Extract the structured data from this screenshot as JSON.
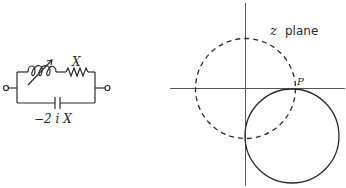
{
  "circuit": {
    "inductor_label": "",
    "resistor_label": "X",
    "capacitor_label": "−2 i X",
    "components": [
      "variable-inductor",
      "resistor",
      "capacitor"
    ]
  },
  "plane": {
    "title_var": "z",
    "title_word": "plane",
    "point_label": "P",
    "curves": [
      {
        "name": "dashed-circle",
        "style": "dashed",
        "center": "origin"
      },
      {
        "name": "solid-circle",
        "style": "solid",
        "tangent_point": "P"
      }
    ]
  },
  "colors": {
    "ink": "#2a2a2a",
    "axis": "#555555",
    "background": "#ffffff"
  }
}
